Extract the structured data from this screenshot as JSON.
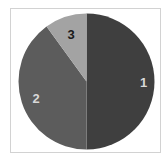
{
  "chart_data": {
    "type": "pie",
    "title": "",
    "categories": [
      "1",
      "2",
      "3"
    ],
    "values": [
      50,
      40,
      10
    ],
    "colors": [
      "#3f3f3f",
      "#5c5c5c",
      "#a3a3a3"
    ],
    "label_colors": [
      "#d8d8d8",
      "#d8d8d8",
      "#1a1a1a"
    ],
    "start_angle_deg": 0,
    "direction": "clockwise from 12 o'clock",
    "legend": "none",
    "labels_inside": true
  },
  "frame": {
    "border_color": "#d2d2d2"
  }
}
